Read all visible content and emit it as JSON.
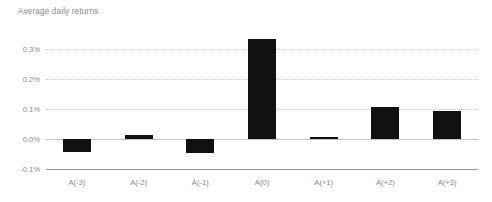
{
  "chart_data": {
    "type": "bar",
    "title": "Average daily returns",
    "xlabel": "",
    "ylabel": "",
    "categories": [
      "A(-3)",
      "A(-2)",
      "A(-1)",
      "A(0)",
      "A(+1)",
      "A(+2)",
      "A(+3)"
    ],
    "values": [
      -0.043,
      0.012,
      -0.045,
      0.335,
      0.008,
      0.107,
      0.092
    ],
    "value_unit": "%",
    "ylim": [
      -0.1,
      0.35
    ],
    "yticks": [
      0.3,
      0.2,
      0.1,
      0.0,
      -0.1
    ],
    "ytick_labels": [
      "0.3%",
      "0.2%",
      "0.1%",
      "0.0%",
      "-0.1%"
    ],
    "grid": true,
    "grid_axis": "y",
    "legend": false,
    "bar_color": "#111111",
    "grid_color": "#c9c9c9",
    "axis_color": "#9a9a9a",
    "text_color": "#8a8a8a",
    "background": "#ffffff"
  }
}
